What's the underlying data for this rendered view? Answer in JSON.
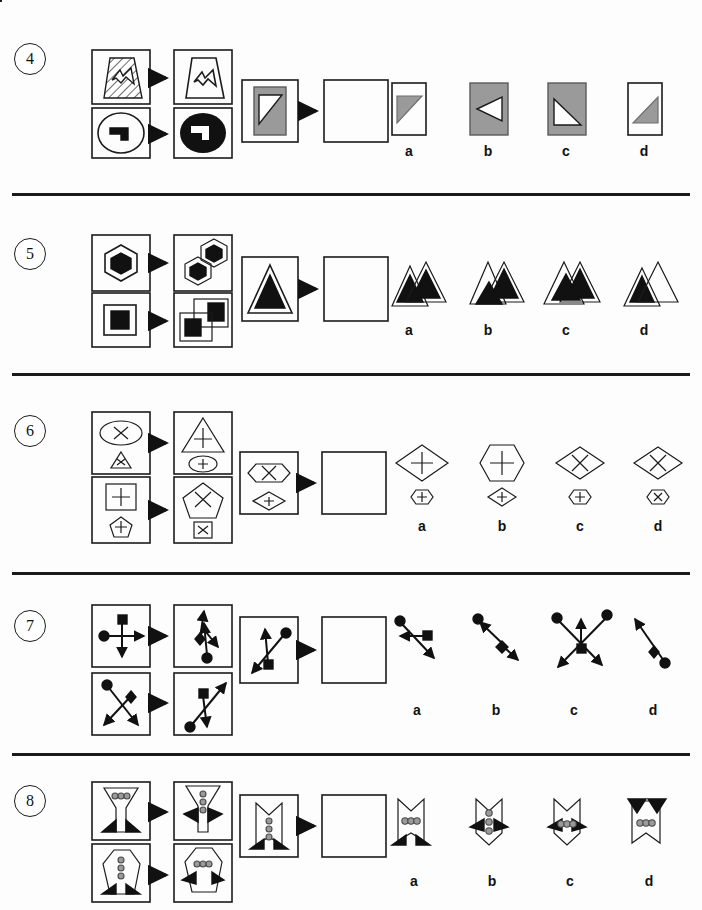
{
  "page": {
    "background_color": "#fdfdfd",
    "ink_color": "#1b1b1b",
    "gray_fill": "#9a9a9a",
    "header_ghost_text": ""
  },
  "answer_letters": [
    "a",
    "b",
    "c",
    "d"
  ],
  "items": [
    {
      "number": "4",
      "number_label": "4",
      "prompt_type": "figure-analogy",
      "examples": [
        {
          "left": "hatched-trapezoid-with-arrow",
          "right": "white-trapezoid-with-small-arrow"
        },
        {
          "left": "white-ellipse-with-black-step-shape",
          "right": "black-ellipse-with-white-step-shape"
        }
      ],
      "source": "gray-rectangle-with-white-triangle",
      "answer_box": "empty",
      "options": [
        {
          "letter": "a",
          "description": "white-rectangle-with-gray-triangle-upper-left"
        },
        {
          "letter": "b",
          "description": "gray-rectangle-with-white-left-pointing-triangle"
        },
        {
          "letter": "c",
          "description": "gray-rectangle-with-white-triangle-lower-right"
        },
        {
          "letter": "d",
          "description": "white-rectangle-with-gray-triangle-lower-right"
        }
      ]
    },
    {
      "number": "5",
      "number_label": "5",
      "prompt_type": "figure-analogy",
      "examples": [
        {
          "left": "white-hexagon-with-black-hexagon",
          "right": "two-overlapping-hexagons-with-black-centers"
        },
        {
          "left": "white-square-with-black-square",
          "right": "two-overlapping-squares-with-black-squares"
        }
      ],
      "source": "white-triangle-with-black-triangle",
      "answer_box": "empty",
      "options": [
        {
          "letter": "a",
          "description": "two-overlapping-triangles-black-inner-left-lower"
        },
        {
          "letter": "b",
          "description": "two-overlapping-triangles-black-inner-right-higher"
        },
        {
          "letter": "c",
          "description": "two-overlapping-triangles-black-inner-right-aligned"
        },
        {
          "letter": "d",
          "description": "two-overlapping-triangles-black-inner-left-only"
        }
      ]
    },
    {
      "number": "6",
      "number_label": "6",
      "prompt_type": "figure-analogy",
      "examples": [
        {
          "left": "ellipse-with-x-above-small-triangle-with-x",
          "right": "triangle-with-plus-above-small-ellipse-with-plus"
        },
        {
          "left": "square-with-plus-above-small-pentagon-with-plus",
          "right": "pentagon-with-x-above-small-square-with-x"
        }
      ],
      "source": "hexagon-with-x-above-small-diamond-with-plus",
      "answer_box": "empty",
      "options": [
        {
          "letter": "a",
          "description": "diamond-with-plus-above-small-hexagon-with-plus"
        },
        {
          "letter": "b",
          "description": "hexagon-with-plus-above-small-diamond-with-plus"
        },
        {
          "letter": "c",
          "description": "diamond-with-x-above-small-hexagon-with-plus"
        },
        {
          "letter": "d",
          "description": "diamond-with-x-above-small-hexagon-with-x"
        }
      ]
    },
    {
      "number": "7",
      "number_label": "7",
      "prompt_type": "figure-analogy",
      "examples": [
        {
          "left": "circle-arrow-right-crossed-by-square-arrow-down",
          "right": "diamond-arrow-up-and-circle-arrow-down-right"
        },
        {
          "left": "circle-arrow-down-right-crossed-by-diamond-arrow-down-left",
          "right": "square-arrow-up-right-and-circle-arrow-down"
        }
      ],
      "source": "circle-arrow-down-left-with-square-arrow-up",
      "answer_box": "empty",
      "options": [
        {
          "letter": "a",
          "description": "circle-arrow-down-right-crossed-by-square-arrow-left"
        },
        {
          "letter": "b",
          "description": "circle-arrow-up-left-and-diamond-arrow-down-right"
        },
        {
          "letter": "c",
          "description": "two-circles-four-arrows-crossed-with-square-center"
        },
        {
          "letter": "d",
          "description": "circle-arrow-up-left-and-diamond-arrow-down-right-reversed"
        }
      ]
    },
    {
      "number": "8",
      "number_label": "8",
      "prompt_type": "figure-analogy",
      "examples": [
        {
          "left": "hourglass-shape-with-three-horizontal-dots-and-black-feet",
          "right": "hourglass-shape-with-three-vertical-dots-and-black-wings"
        },
        {
          "left": "hexagon-shape-with-three-vertical-dots-and-black-feet",
          "right": "hexagon-shape-with-three-horizontal-dots-and-black-wings"
        }
      ],
      "source": "notched-banner-with-three-vertical-dots-and-black-feet",
      "answer_box": "empty",
      "options": [
        {
          "letter": "a",
          "description": "notched-banner-with-three-horizontal-dots-and-black-feet"
        },
        {
          "letter": "b",
          "description": "notched-banner-with-three-vertical-dots-and-black-wings"
        },
        {
          "letter": "c",
          "description": "notched-banner-with-three-horizontal-dots-and-black-wings"
        },
        {
          "letter": "d",
          "description": "banner-with-three-horizontal-dots-and-black-top-wings"
        }
      ]
    }
  ]
}
